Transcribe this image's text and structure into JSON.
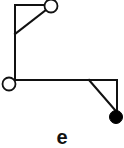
{
  "diagram": {
    "label": "e",
    "stroke_color": "#111111",
    "fill_color": "#ffffff",
    "filled_node_color": "#000000",
    "nodes": [
      {
        "id": "top-open-node",
        "cx": 51,
        "cy": 6,
        "r": 6.5,
        "filled": false
      },
      {
        "id": "left-open-node",
        "cx": 9,
        "cy": 84,
        "r": 6.5,
        "filled": false
      },
      {
        "id": "right-filled-node",
        "cx": 116,
        "cy": 117,
        "r": 6.5,
        "filled": true
      }
    ],
    "edges": [
      {
        "id": "top-horizontal",
        "x1": 15,
        "y1": 5,
        "x2": 45,
        "y2": 5
      },
      {
        "id": "left-vertical",
        "x1": 15,
        "y1": 5,
        "x2": 15,
        "y2": 80
      },
      {
        "id": "top-diagonal",
        "x1": 46,
        "y1": 10,
        "x2": 15,
        "y2": 34
      },
      {
        "id": "bottom-horizontal",
        "x1": 15,
        "y1": 80,
        "x2": 117,
        "y2": 80
      },
      {
        "id": "right-vertical",
        "x1": 117,
        "y1": 80,
        "x2": 117,
        "y2": 111
      },
      {
        "id": "bottom-diagonal",
        "x1": 89,
        "y1": 80,
        "x2": 115,
        "y2": 110
      }
    ]
  }
}
